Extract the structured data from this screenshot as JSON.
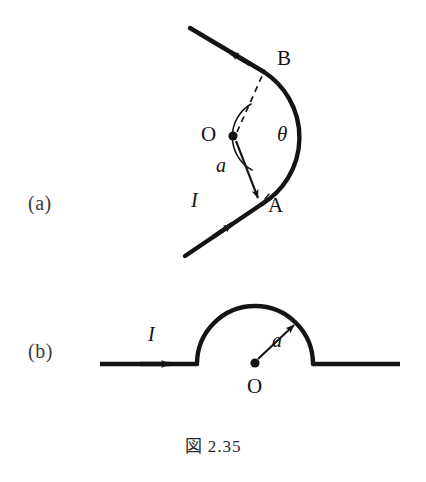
{
  "figure": {
    "caption": "図 2.35",
    "background_color": "#ffffff",
    "ink_color": "#141414"
  },
  "panels": [
    {
      "id": "a",
      "label": "(a)",
      "description": "Wire bent into a circular arc of radius a subtending angle theta at center O, with straight leads from A and to B",
      "labels": {
        "center": "O",
        "angle": "θ",
        "radius": "a",
        "current": "I",
        "point_start": "A",
        "point_end": "B"
      }
    },
    {
      "id": "b",
      "label": "(b)",
      "description": "Straight wire with a semicircular detour of radius a about center O",
      "labels": {
        "center": "O",
        "radius": "a",
        "current": "I"
      }
    }
  ],
  "geometry": {
    "panel_a": {
      "center": {
        "x": 233,
        "y": 136
      },
      "radius": 78,
      "arc_start_angle_deg": 56,
      "arc_end_angle_deg": -56,
      "angle_marker_radius": 38,
      "point_A": {
        "x": 262,
        "y": 204
      },
      "point_B": {
        "x": 264,
        "y": 72
      },
      "lead_in_start": {
        "x": 185,
        "y": 256
      },
      "lead_out_end": {
        "x": 190,
        "y": 28
      }
    },
    "panel_b": {
      "center": {
        "x": 255,
        "y": 364
      },
      "radius": 58,
      "wire_left_x": 100,
      "wire_right_x": 400,
      "wire_y": 364,
      "radius_arrow_tip": {
        "x": 296,
        "y": 323
      }
    }
  }
}
